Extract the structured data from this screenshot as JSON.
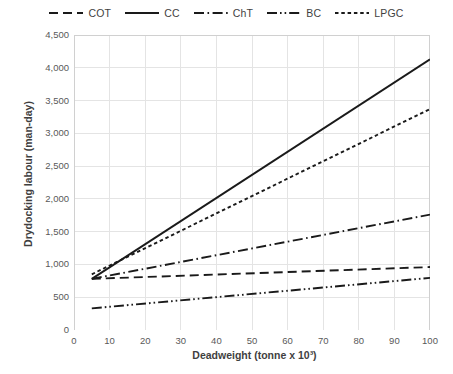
{
  "chart_data": {
    "type": "line",
    "title": "",
    "xlabel": "Deadweight (tonne x 10³)",
    "ylabel": "Drydocking labour (man-day)",
    "xlim": [
      0,
      100
    ],
    "ylim": [
      0,
      4500
    ],
    "xticks": [
      0,
      10,
      20,
      30,
      40,
      50,
      60,
      70,
      80,
      90,
      100
    ],
    "xtick_labels": [
      "0",
      "10",
      "20",
      "30",
      "40",
      "50",
      "60",
      "70",
      "80",
      "90",
      "100"
    ],
    "yticks": [
      0,
      500,
      1000,
      1500,
      2000,
      2500,
      3000,
      3500,
      4000,
      4500
    ],
    "ytick_labels": [
      "0",
      "500",
      "1,000",
      "1,500",
      "2,000",
      "2,500",
      "3,000",
      "3,500",
      "4,000",
      "4,500"
    ],
    "grid": true,
    "legend_position": "top",
    "x": [
      5,
      100
    ],
    "series": [
      {
        "name": "COT",
        "label": "COT",
        "dash": "dashed",
        "color": "#1a1a1a",
        "values": [
          780,
          960
        ]
      },
      {
        "name": "CC",
        "label": "CC",
        "dash": "solid",
        "color": "#1a1a1a",
        "values": [
          780,
          4130
        ]
      },
      {
        "name": "ChT",
        "label": "ChT",
        "dash": "dash-dot",
        "color": "#1a1a1a",
        "values": [
          780,
          1760
        ]
      },
      {
        "name": "BC",
        "label": "BC",
        "dash": "dash-dot-dot",
        "color": "#1a1a1a",
        "values": [
          330,
          795
        ]
      },
      {
        "name": "LPGC",
        "label": "LPGC",
        "dash": "dotted",
        "color": "#1a1a1a",
        "values": [
          850,
          3370
        ]
      }
    ]
  },
  "colors": {
    "background": "#ffffff",
    "grid": "#e4e4e4",
    "axis": "#d0d0d0",
    "text": "#3f3f3f",
    "tick_text": "#595959",
    "line": "#1a1a1a"
  }
}
